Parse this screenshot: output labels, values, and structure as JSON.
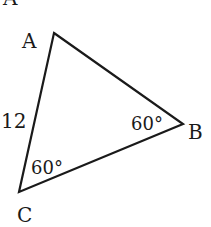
{
  "diagram": {
    "type": "triangle",
    "problem_label": "A",
    "vertices": {
      "A": {
        "label": "A",
        "x": 54,
        "y": 33
      },
      "B": {
        "label": "B",
        "x": 183,
        "y": 124
      },
      "C": {
        "label": "C",
        "x": 19,
        "y": 192
      }
    },
    "side_labels": {
      "AC": "12"
    },
    "angle_labels": {
      "B": "60°",
      "C": "60°"
    },
    "colors": {
      "stroke": "#1a1a1a",
      "background": "#ffffff"
    }
  }
}
